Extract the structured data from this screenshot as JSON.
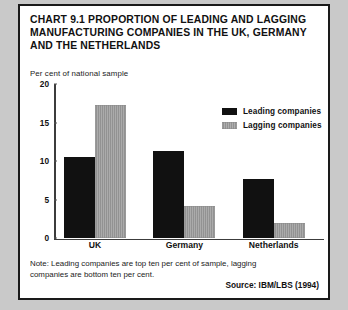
{
  "figure": {
    "title": "CHART 9.1 PROPORTION OF LEADING AND LAGGING  MANUFACTURING COMPANIES IN THE UK, GERMANY AND THE NETHERLANDS",
    "note": "Note: Leading companies are top ten per cent of sample, lagging companies are bottom ten per cent.",
    "source": "Source: IBM/LBS (1994)",
    "colors": {
      "leading": "#111111",
      "lagging": "#9a9a9a",
      "border": "#1a1a1a",
      "page_background": "#c9c9c9",
      "plot_background": "#ffffff"
    }
  },
  "chart_data": {
    "type": "bar",
    "title": "CHART 9.1 PROPORTION OF LEADING AND LAGGING  MANUFACTURING COMPANIES IN THE UK, GERMANY AND THE NETHERLANDS",
    "xlabel": "",
    "ylabel": "Per cent of national sample",
    "ylim": [
      0,
      20
    ],
    "yticks": [
      "0",
      "5",
      "10",
      "15",
      "20"
    ],
    "ytick_values": [
      0,
      5,
      10,
      15,
      20
    ],
    "grid": false,
    "legend_position": "upper right inside",
    "categories": [
      "UK",
      "Germany",
      "Netherlands"
    ],
    "series": [
      {
        "name": "Leading companies",
        "color": "#111111",
        "values": [
          10.5,
          11.3,
          7.6
        ]
      },
      {
        "name": "Lagging companies",
        "color": "#9a9a9a",
        "values": [
          17.3,
          4.1,
          2.0
        ]
      }
    ]
  }
}
